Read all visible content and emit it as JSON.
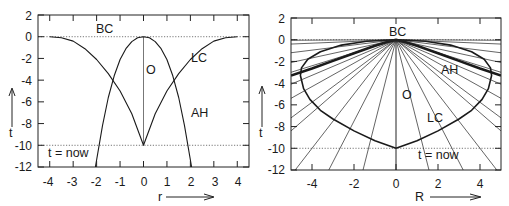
{
  "chart_data": [
    {
      "type": "line",
      "title": "",
      "xlabel": "r",
      "ylabel": "t",
      "xlim": [
        -4.5,
        4.5
      ],
      "ylim": [
        -12,
        2
      ],
      "xticks": [
        -4,
        -3,
        -2,
        -1,
        0,
        1,
        2,
        3,
        4
      ],
      "yticks": [
        2,
        0,
        -2,
        -4,
        -6,
        -8,
        -10,
        -12
      ],
      "grid": false,
      "legend": null,
      "reference_lines": [
        {
          "name": "BC",
          "orientation": "horizontal",
          "t": 0,
          "style": "dotted"
        },
        {
          "name": "t = now",
          "orientation": "horizontal",
          "t": -10,
          "style": "dotted"
        },
        {
          "name": "O",
          "orientation": "vertical",
          "r": 0,
          "t_range": [
            -10,
            0
          ],
          "style": "solid"
        }
      ],
      "series": [
        {
          "name": "LC",
          "x": [
            -4.0,
            -3.5,
            -3.0,
            -2.5,
            -2.0,
            -1.5,
            -1.0,
            -0.5,
            0.0,
            0.5,
            1.0,
            1.5,
            2.0,
            2.5,
            3.0,
            3.5,
            4.0
          ],
          "values": [
            0.0,
            -0.1,
            -0.4,
            -1.1,
            -2.1,
            -3.4,
            -5.0,
            -7.1,
            -10.0,
            -7.1,
            -5.0,
            -3.4,
            -2.1,
            -1.1,
            -0.4,
            -0.1,
            0.0
          ]
        },
        {
          "name": "AH",
          "x": [
            -2.05,
            -1.75,
            -1.5,
            -1.25,
            -1.0,
            -0.75,
            -0.5,
            -0.25,
            0.0,
            0.25,
            0.5,
            0.75,
            1.0,
            1.25,
            1.5,
            1.75,
            2.05
          ],
          "values": [
            -12.0,
            -8.2,
            -5.6,
            -3.6,
            -2.1,
            -1.1,
            -0.45,
            -0.1,
            0.0,
            -0.1,
            -0.45,
            -1.1,
            -2.1,
            -3.6,
            -5.6,
            -8.2,
            -12.0
          ]
        }
      ],
      "annotations": [
        {
          "text": "BC",
          "r": -1.5,
          "t": 0.6
        },
        {
          "text": "O",
          "r": 0.5,
          "t": -3.0
        },
        {
          "text": "LC",
          "r": 3.0,
          "t": -2.1
        },
        {
          "text": "AH",
          "r": 3.0,
          "t": -7.0
        },
        {
          "text": "t = now",
          "r": -3.9,
          "t": -10.6
        }
      ]
    },
    {
      "type": "line",
      "title": "",
      "xlabel": "R",
      "ylabel": "t",
      "xlim": [
        -5,
        5
      ],
      "ylim": [
        -12,
        2
      ],
      "xticks": [
        -4,
        -2,
        0,
        2,
        4
      ],
      "yticks": [
        2,
        0,
        -2,
        -4,
        -6,
        -8,
        -10,
        -12
      ],
      "grid": false,
      "legend": null,
      "reference_lines": [
        {
          "name": "BC",
          "orientation": "horizontal",
          "t": 0,
          "style": "dotted"
        },
        {
          "name": "t = now",
          "orientation": "horizontal",
          "t": -10,
          "style": "dotted"
        },
        {
          "name": "O",
          "orientation": "vertical",
          "R": 0,
          "t_range": [
            -12,
            0
          ],
          "style": "solid"
        }
      ],
      "series": [
        {
          "name": "LC",
          "x": [
            0.0,
            1.0,
            2.0,
            3.0,
            3.6,
            4.1,
            4.4,
            4.55,
            4.5,
            4.2,
            3.6,
            2.6,
            1.4,
            0.0,
            -1.4,
            -2.6,
            -3.6,
            -4.2,
            -4.5,
            -4.55,
            -4.4,
            -4.1,
            -3.6,
            -3.0,
            -2.0,
            -1.0,
            0.0
          ],
          "values": [
            -10.0,
            -9.3,
            -8.4,
            -7.3,
            -6.5,
            -5.5,
            -4.5,
            -3.3,
            -2.6,
            -1.8,
            -1.1,
            -0.5,
            -0.15,
            0.0,
            -0.15,
            -0.5,
            -1.1,
            -1.8,
            -2.6,
            -3.3,
            -4.5,
            -5.5,
            -6.5,
            -7.3,
            -8.4,
            -9.3,
            -10.0
          ]
        },
        {
          "name": "AH",
          "x": [
            -5.0,
            -4.0,
            -3.0,
            -2.0,
            -1.0,
            -0.5,
            0.0,
            0.5,
            1.0,
            2.0,
            3.0,
            4.0,
            5.0
          ],
          "values": [
            -3.3,
            -2.65,
            -1.95,
            -1.25,
            -0.55,
            -0.25,
            0.0,
            -0.25,
            -0.55,
            -1.25,
            -1.95,
            -2.65,
            -3.3
          ]
        },
        {
          "name": "comoving world lines",
          "note": "fan of straight lines radiating from (R=0, t=0)",
          "endpoints_R_at_t_minus_12": [
            -4.8,
            -3.2,
            -1.57,
            1.57,
            3.2,
            4.8
          ],
          "endpoints_t_at_R_plus_minus_5": [
            -0.05,
            -0.4,
            -1.2,
            -2.1,
            -3.0,
            -4.1,
            -5.4,
            -7.2,
            -8.4
          ]
        }
      ],
      "annotations": [
        {
          "text": "BC",
          "R": 0.0,
          "t": 0.7
        },
        {
          "text": "AH",
          "R": 3.0,
          "t": -2.9
        },
        {
          "text": "O",
          "R": 0.6,
          "t": -5.0
        },
        {
          "text": "LC",
          "R": 2.1,
          "t": -7.3
        },
        {
          "text": "t = now",
          "R": 2.3,
          "t": -10.8
        }
      ]
    }
  ],
  "plot_left": {
    "yticks": [
      "2",
      "0",
      "-2",
      "-4",
      "-6",
      "-8",
      "-10",
      "-12"
    ],
    "xticks": [
      "-4",
      "-3",
      "-2",
      "-1",
      "0",
      "1",
      "2",
      "3",
      "4"
    ],
    "xlabel": "r",
    "ylabel": "t",
    "labels": {
      "bc": "BC",
      "o": "O",
      "lc": "LC",
      "ah": "AH",
      "now": "t = now"
    }
  },
  "plot_right": {
    "yticks": [
      "2",
      "0",
      "-2",
      "-4",
      "-6",
      "-8",
      "-10",
      "-12"
    ],
    "xticks": [
      "-4",
      "-2",
      "0",
      "2",
      "4"
    ],
    "xlabel": "R",
    "ylabel": "t",
    "labels": {
      "bc": "BC",
      "o": "O",
      "lc": "LC",
      "ah": "AH",
      "now": "t = now"
    }
  }
}
